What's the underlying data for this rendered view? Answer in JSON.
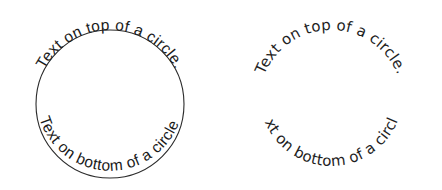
{
  "canvas": {
    "width": 442,
    "height": 190,
    "background_color": "#ffffff",
    "ink_color": "#1a1a1a"
  },
  "panels": [
    {
      "id": "left",
      "name": "circle-text-with-visible-circle",
      "circle_visible": true,
      "circle_stroke_color": "#2b2b2b",
      "center_x": 110,
      "center_y": 104,
      "radius": 74,
      "top_text": "Text on top of a circle.",
      "bottom_text": "Text on bottom of a circle.",
      "font_style": "narrow-sans"
    },
    {
      "id": "right",
      "name": "circle-text-without-visible-circle",
      "circle_visible": false,
      "circle_stroke_color": "none",
      "center_x": 110,
      "center_y": 102,
      "radius": 72,
      "top_text": "Text on top of a circle.",
      "bottom_text": "Text on bottom of a circle.",
      "font_style": "round-sans"
    }
  ]
}
